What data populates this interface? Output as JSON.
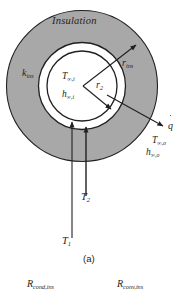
{
  "figure": {
    "caption": "(a)",
    "title_label": "Insulation",
    "colors": {
      "insulation_fill": "#a8a8a8",
      "insulation_stroke": "#231f20",
      "tube_fill": "#ffffff",
      "line": "#231f20",
      "background": "#ffffff"
    },
    "labels": {
      "insulation": "Insulation",
      "k_ins_base": "k",
      "k_ins_sub": "ins",
      "r_ins_base": "r",
      "r_ins_sub": "ins",
      "r2_base": "r",
      "r2_sub": "2",
      "T_inf_i_base": "T",
      "T_inf_i_sub": "∞,i",
      "h_inf_i_base": "h",
      "h_inf_i_sub": "∞,i",
      "q_dot_base": "q",
      "T_inf_o_base": "T",
      "T_inf_o_sub": "∞,o",
      "h_inf_o_base": "h",
      "h_inf_o_sub": "∞,o",
      "T2_base": "T",
      "T2_sub": "2",
      "T1_base": "T",
      "T1_sub": "1",
      "R_cond_base": "R",
      "R_cond_sub": "cond,ins",
      "R_conv_base": "R",
      "R_conv_sub": "conv,ins"
    },
    "geometry": {
      "center_x": 82,
      "center_y": 86,
      "r_outer": 76,
      "r_tube_outer": 44,
      "r_tube_inner": 35
    }
  }
}
